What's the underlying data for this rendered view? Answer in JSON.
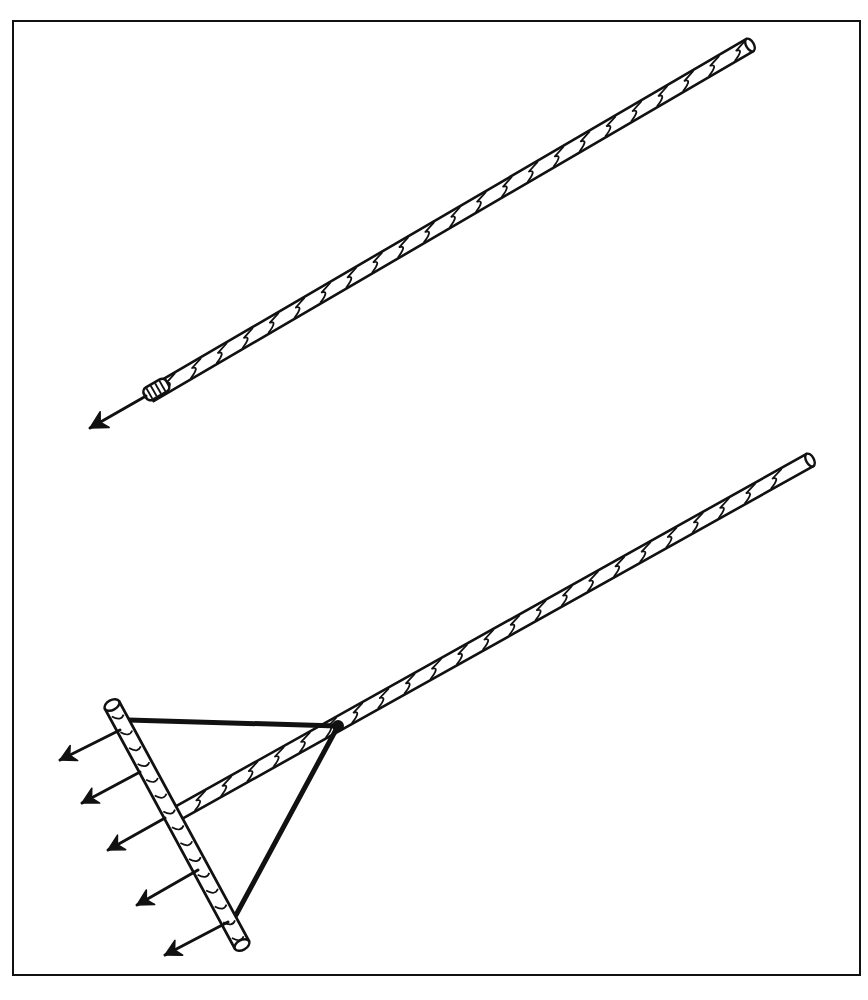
{
  "figure": {
    "description": "Line illustration of two tools: a single-tipped spear/probe on a long twisted shaft (top) and a rake-like tool with five arrow-tipped tines on a crossbar, braced by a triangular frame, on a long twisted shaft (bottom).",
    "ink_color": "#111111",
    "paper_color": "#ffffff",
    "frame": {
      "x": 12,
      "y": 20,
      "width": 849,
      "height": 956
    },
    "top_tool": {
      "label": "single-point shaft",
      "shaft_start": [
        150,
        395
      ],
      "shaft_end": [
        750,
        45
      ],
      "shaft_width": 14,
      "tip": [
        90,
        428
      ],
      "ferrule_at": [
        152,
        392
      ]
    },
    "bottom_tool": {
      "label": "multi-tine rake",
      "shaft_start": [
        180,
        812
      ],
      "shaft_end": [
        810,
        460
      ],
      "shaft_width": 14,
      "crossbar_start": [
        112,
        705
      ],
      "crossbar_end": [
        242,
        945
      ],
      "brace_apex": [
        338,
        726
      ],
      "brace_top": [
        128,
        720
      ],
      "brace_bottom": [
        236,
        915
      ],
      "tines": [
        {
          "from": [
            120,
            730
          ],
          "to": [
            60,
            760
          ]
        },
        {
          "from": [
            140,
            772
          ],
          "to": [
            82,
            803
          ]
        },
        {
          "from": [
            165,
            818
          ],
          "to": [
            108,
            850
          ]
        },
        {
          "from": [
            198,
            870
          ],
          "to": [
            137,
            905
          ]
        },
        {
          "from": [
            228,
            922
          ],
          "to": [
            165,
            955
          ]
        }
      ]
    }
  }
}
